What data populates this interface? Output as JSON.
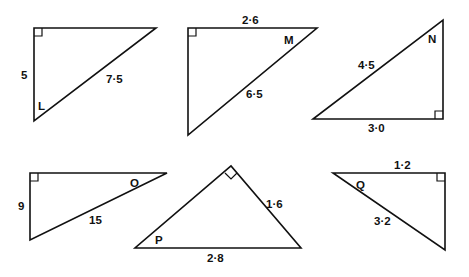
{
  "figure": {
    "type": "right-triangle-trigonometry-exercise",
    "triangles": [
      {
        "id": "L",
        "angle_label": "L",
        "sides": [
          {
            "label": "5",
            "position": "left-vertical"
          },
          {
            "label": "7·5",
            "position": "hypotenuse"
          }
        ],
        "right_angle": "top-left"
      },
      {
        "id": "M",
        "angle_label": "M",
        "sides": [
          {
            "label": "2·6",
            "position": "top-horizontal"
          },
          {
            "label": "6·5",
            "position": "hypotenuse"
          }
        ],
        "right_angle": "top-left"
      },
      {
        "id": "N",
        "angle_label": "N",
        "sides": [
          {
            "label": "4·5",
            "position": "hypotenuse"
          },
          {
            "label": "3·0",
            "position": "bottom-horizontal"
          }
        ],
        "right_angle": "bottom-right"
      },
      {
        "id": "O",
        "angle_label": "O",
        "sides": [
          {
            "label": "9",
            "position": "left-vertical"
          },
          {
            "label": "15",
            "position": "hypotenuse"
          }
        ],
        "right_angle": "top-left"
      },
      {
        "id": "P",
        "angle_label": "P",
        "sides": [
          {
            "label": "1·6",
            "position": "right-slant"
          },
          {
            "label": "2·8",
            "position": "hypotenuse-base"
          }
        ],
        "right_angle": "apex"
      },
      {
        "id": "Q",
        "angle_label": "Q",
        "sides": [
          {
            "label": "1·2",
            "position": "top-horizontal"
          },
          {
            "label": "3·2",
            "position": "hypotenuse"
          }
        ],
        "right_angle": "top-right"
      }
    ]
  }
}
